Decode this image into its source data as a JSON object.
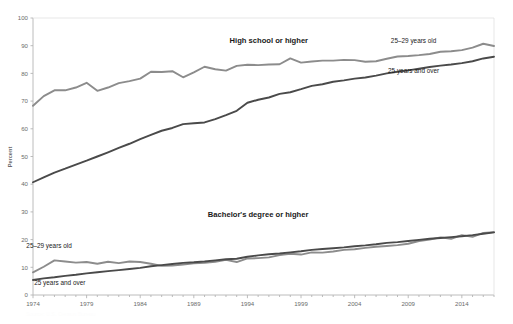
{
  "chart_data": {
    "type": "line",
    "title": "",
    "xlabel": "",
    "ylabel": "Percent",
    "xlim": [
      1974,
      2017
    ],
    "ylim": [
      0,
      100
    ],
    "ytick_values": [
      0,
      10,
      20,
      30,
      40,
      50,
      60,
      70,
      80,
      90,
      100
    ],
    "ytick_labels": [
      "0",
      "10",
      "20",
      "30",
      "40",
      "50",
      "60",
      "70",
      "80",
      "90",
      "100"
    ],
    "xtick_values": [
      1974,
      1979,
      1984,
      1989,
      1994,
      1999,
      2004,
      2009,
      2014
    ],
    "xtick_labels": [
      "1974",
      "1979",
      "1984",
      "1989",
      "1994",
      "1999",
      "2004",
      "2009",
      "2014"
    ],
    "grid": false,
    "legend_position": "inline-annotations",
    "x": [
      1974,
      1975,
      1976,
      1977,
      1978,
      1979,
      1980,
      1981,
      1982,
      1983,
      1984,
      1985,
      1986,
      1987,
      1988,
      1989,
      1990,
      1991,
      1992,
      1993,
      1994,
      1995,
      1996,
      1997,
      1998,
      1999,
      2000,
      2001,
      2002,
      2003,
      2004,
      2005,
      2006,
      2007,
      2008,
      2009,
      2010,
      2011,
      2012,
      2013,
      2014,
      2015,
      2016,
      2017
    ],
    "annotations": [
      {
        "text": "High school or higher",
        "x": 1996,
        "y": 91,
        "bold": true
      },
      {
        "text": "Bachelor's degree or higher",
        "x": 1995,
        "y": 28,
        "bold": true
      },
      {
        "text": "25–29 years old",
        "x": 2009.5,
        "y": 91,
        "bold": false
      },
      {
        "text": "25 years and over",
        "x": 2009.5,
        "y": 80,
        "bold": false
      },
      {
        "text": "25–29 years old",
        "x": 1975.5,
        "y": 17,
        "bold": false
      },
      {
        "text": "25 years and over",
        "x": 1976.5,
        "y": 3.5,
        "bold": false
      }
    ],
    "series": [
      {
        "name": "High school or higher, 25–29 years old",
        "group": "High school or higher",
        "age_group": "25–29 years old",
        "color": "#8c8c8c",
        "values": [
          68.3,
          71.8,
          73.9,
          73.9,
          74.9,
          76.6,
          73.7,
          74.9,
          76.5,
          77.2,
          78.1,
          80.6,
          80.5,
          80.8,
          78.6,
          80.4,
          82.4,
          81.5,
          81.0,
          82.7,
          83.1,
          83.0,
          83.2,
          83.3,
          85.4,
          83.9,
          84.3,
          84.6,
          84.6,
          84.9,
          84.8,
          84.2,
          84.4,
          85.3,
          86.1,
          86.3,
          86.6,
          87.0,
          87.8,
          88.0,
          88.4,
          89.3,
          90.7,
          89.9
        ]
      },
      {
        "name": "High school or higher, 25 years and over",
        "group": "High school or higher",
        "age_group": "25 years and over",
        "color": "#4a4a4a",
        "values": [
          40.7,
          42.5,
          44.2,
          45.6,
          47.1,
          48.5,
          50.0,
          51.5,
          53.1,
          54.6,
          56.3,
          57.8,
          59.3,
          60.3,
          61.7,
          62.0,
          62.3,
          63.5,
          64.9,
          66.5,
          69.4,
          70.5,
          71.3,
          72.6,
          73.2,
          74.3,
          75.5,
          76.1,
          77.0,
          77.5,
          78.1,
          78.5,
          79.2,
          80.0,
          80.6,
          81.1,
          81.7,
          82.3,
          82.8,
          83.2,
          83.7,
          84.4,
          85.4,
          86.0
        ]
      },
      {
        "name": "Bachelor's degree or higher, 25–29 years old",
        "group": "Bachelor's degree or higher",
        "age_group": "25–29 years old",
        "color": "#8c8c8c",
        "values": [
          8.2,
          10.2,
          12.5,
          12.1,
          11.7,
          11.9,
          11.3,
          12.0,
          11.5,
          12.1,
          11.9,
          11.3,
          10.5,
          10.6,
          11.0,
          11.4,
          11.6,
          12.0,
          12.7,
          11.9,
          13.2,
          13.3,
          13.6,
          14.4,
          14.9,
          14.6,
          15.4,
          15.3,
          15.7,
          16.3,
          16.5,
          17.0,
          17.4,
          17.7,
          18.0,
          18.5,
          19.5,
          20.0,
          20.8,
          20.3,
          21.6,
          21.0,
          22.4,
          22.7
        ]
      },
      {
        "name": "Bachelor's degree or higher, 25 years and over",
        "group": "Bachelor's degree or higher",
        "age_group": "25 years and over",
        "color": "#4a4a4a",
        "values": [
          5.4,
          6.0,
          6.4,
          6.9,
          7.3,
          7.8,
          8.2,
          8.6,
          9.0,
          9.4,
          9.8,
          10.4,
          10.8,
          11.2,
          11.6,
          11.8,
          12.1,
          12.5,
          12.9,
          13.1,
          13.8,
          14.3,
          14.7,
          15.0,
          15.4,
          15.8,
          16.3,
          16.6,
          16.9,
          17.2,
          17.6,
          17.9,
          18.3,
          18.8,
          19.1,
          19.5,
          19.9,
          20.3,
          20.6,
          20.9,
          21.2,
          21.6,
          22.1,
          22.6
        ]
      }
    ]
  },
  "footer": {
    "note": "Source: U.S. Census Bureau"
  }
}
